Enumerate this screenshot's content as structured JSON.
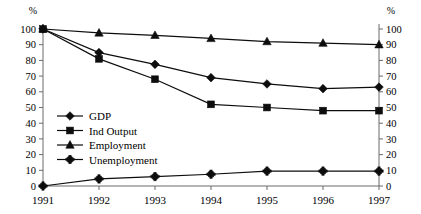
{
  "chart_data": {
    "type": "line",
    "title": "",
    "xlabel": "",
    "ylabel": "%",
    "ylabel_right": "%",
    "categories": [
      "1991",
      "1992",
      "1993",
      "1994",
      "1995",
      "1996",
      "1997"
    ],
    "x": [
      1991,
      1992,
      1993,
      1994,
      1995,
      1996,
      1997
    ],
    "ylim": [
      0,
      100
    ],
    "yticks": [
      0,
      10,
      20,
      30,
      40,
      50,
      60,
      70,
      80,
      90,
      100
    ],
    "ylim_right": [
      0,
      100
    ],
    "yticks_right": [
      0,
      10,
      20,
      30,
      40,
      50,
      60,
      70,
      80,
      90,
      100
    ],
    "grid": false,
    "legend_position": "inside-left",
    "series": [
      {
        "name": "GDP",
        "marker": "diamond",
        "color": "#0d0d0d",
        "values": [
          100,
          85,
          77.5,
          69,
          65,
          62,
          63
        ]
      },
      {
        "name": "Ind Output",
        "marker": "square",
        "color": "#0d0d0d",
        "values": [
          100,
          81,
          68,
          52,
          50,
          48,
          48
        ]
      },
      {
        "name": "Employment",
        "marker": "triangle",
        "color": "#0d0d0d",
        "values": [
          100,
          97.5,
          96,
          94,
          92,
          91,
          90
        ]
      },
      {
        "name": "Unemployment",
        "marker": "star",
        "color": "#0d0d0d",
        "values": [
          0,
          4.5,
          6,
          7.5,
          9.5,
          9.5,
          9.5
        ]
      }
    ]
  },
  "axis": {
    "left_unit": "%",
    "right_unit": "%"
  }
}
